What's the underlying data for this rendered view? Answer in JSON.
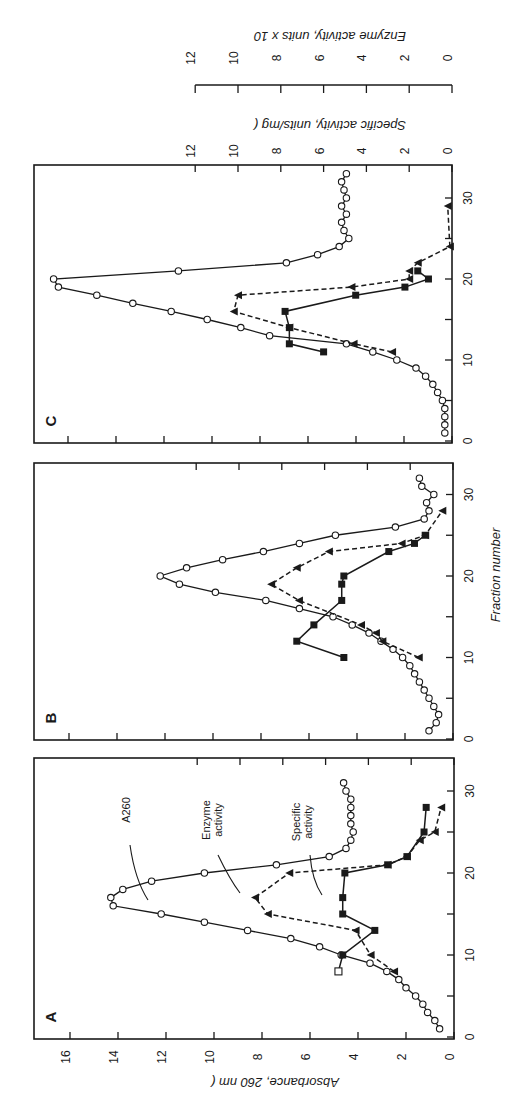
{
  "chart_data": [
    {
      "panel": "A",
      "type": "line",
      "title": "A",
      "xlabel": "Fraction number",
      "ylabel": "Absorbance, 260 nm (o—o)",
      "y2label": "Specific activity, units/mg (■—■)",
      "y3label": "Enzyme activity, units x 10^3 (▲- - -▲)",
      "xlim": [
        0,
        33
      ],
      "ylim": [
        0,
        17
      ],
      "x_ticks": [
        0,
        10,
        20,
        30
      ],
      "y_ticks": [
        0,
        2,
        4,
        6,
        8,
        10,
        12,
        14,
        16
      ],
      "annotations": [
        "A260",
        "Enzyme activity",
        "Specific activity"
      ],
      "series": [
        {
          "name": "A260",
          "marker": "open-circle",
          "line": "solid",
          "x": [
            1,
            2,
            3,
            4,
            5,
            6,
            7,
            8,
            9,
            10,
            11,
            12,
            13,
            14,
            15,
            16,
            17,
            18,
            19,
            20,
            21,
            22,
            23,
            24,
            25,
            26,
            27,
            28,
            29,
            30,
            31
          ],
          "y": [
            0.6,
            0.8,
            1.1,
            1.3,
            1.6,
            2.0,
            2.3,
            2.8,
            3.5,
            4.7,
            5.6,
            6.8,
            8.6,
            10.4,
            12.2,
            14.2,
            14.3,
            13.8,
            12.6,
            10.4,
            7.4,
            5.2,
            4.5,
            4.3,
            4.2,
            4.3,
            4.3,
            4.3,
            4.3,
            4.5,
            4.6
          ]
        },
        {
          "name": "Specific activity",
          "marker": "filled-square",
          "line": "solid",
          "x": [
            8,
            10,
            13,
            15,
            17,
            20,
            21,
            22,
            25,
            28
          ],
          "y": [
            5.4,
            5.2,
            3.7,
            5.2,
            5.2,
            5.1,
            3.1,
            2.2,
            1.4,
            1.3
          ]
        },
        {
          "name": "Enzyme activity",
          "marker": "filled-triangle",
          "line": "dashed",
          "x": [
            8,
            10,
            13,
            15,
            17,
            20,
            21,
            22,
            24,
            25,
            28
          ],
          "y": [
            2.8,
            3.9,
            4.6,
            8.7,
            9.3,
            7.7,
            3.1,
            2.2,
            1.6,
            0.9,
            0.6
          ]
        }
      ]
    },
    {
      "panel": "B",
      "type": "line",
      "title": "B",
      "xlabel": "Fraction number",
      "xlim": [
        0,
        33
      ],
      "x_ticks": [
        0,
        10,
        20,
        30
      ],
      "series": [
        {
          "name": "A260",
          "marker": "open-circle",
          "line": "solid",
          "x": [
            1,
            2,
            3,
            4,
            5,
            6,
            7,
            8,
            9,
            10,
            11,
            12,
            13,
            14,
            15,
            16,
            17,
            18,
            19,
            20,
            21,
            22,
            23,
            24,
            25,
            26,
            27,
            28,
            29,
            30,
            31,
            32
          ],
          "y": [
            1.0,
            0.7,
            0.6,
            0.8,
            1.0,
            1.2,
            1.4,
            1.6,
            1.8,
            2.1,
            2.5,
            3.0,
            3.5,
            4.2,
            5.0,
            6.4,
            7.8,
            9.9,
            11.4,
            12.2,
            11.1,
            9.6,
            7.9,
            6.4,
            4.9,
            2.4,
            1.2,
            1.0,
            1.1,
            0.8,
            1.3,
            1.4
          ]
        },
        {
          "name": "Specific activity",
          "marker": "filled-square",
          "line": "solid",
          "x": [
            10,
            12,
            14,
            17,
            19,
            20,
            23,
            24,
            25
          ],
          "y": [
            5.1,
            7.3,
            6.5,
            5.2,
            5.2,
            5.1,
            3.0,
            1.8,
            1.3
          ]
        },
        {
          "name": "Enzyme activity",
          "marker": "filled-triangle",
          "line": "dashed",
          "x": [
            10,
            12,
            13,
            14,
            17,
            19,
            21,
            23,
            24,
            25,
            28
          ],
          "y": [
            1.6,
            3.3,
            3.6,
            4.3,
            7.2,
            8.5,
            7.3,
            5.8,
            2.4,
            1.3,
            0.5
          ]
        }
      ]
    },
    {
      "panel": "C",
      "type": "line",
      "title": "C",
      "xlabel": "Fraction number",
      "xlim": [
        0,
        33
      ],
      "x_ticks": [
        0,
        10,
        20,
        30
      ],
      "y2_ticks": [
        0,
        2,
        4,
        6,
        8,
        10,
        12
      ],
      "y3_ticks": [
        0,
        2,
        4,
        6,
        8,
        10,
        12
      ],
      "series": [
        {
          "name": "A260",
          "marker": "open-circle",
          "line": "solid",
          "x": [
            1,
            2,
            3,
            4,
            5,
            6,
            7,
            8,
            9,
            10,
            11,
            12,
            13,
            14,
            15,
            16,
            17,
            18,
            19,
            20,
            21,
            22,
            23,
            24,
            25,
            26,
            27,
            28,
            29,
            30,
            31,
            32,
            33
          ],
          "y": [
            0.3,
            0.3,
            0.3,
            0.3,
            0.4,
            0.6,
            0.8,
            1.1,
            1.5,
            2.3,
            3.3,
            4.4,
            7.6,
            8.8,
            10.2,
            11.7,
            13.3,
            14.8,
            16.4,
            16.6,
            11.4,
            6.9,
            5.6,
            4.7,
            4.3,
            4.5,
            4.6,
            4.4,
            4.6,
            4.4,
            4.5,
            4.6,
            4.4
          ]
        },
        {
          "name": "Specific activity",
          "marker": "filled-square",
          "line": "solid",
          "x": [
            11,
            12,
            14,
            16,
            18,
            19,
            20,
            21
          ],
          "y": [
            6.0,
            7.6,
            7.6,
            7.8,
            4.5,
            2.2,
            1.1,
            1.6
          ]
        },
        {
          "name": "Enzyme activity",
          "marker": "filled-triangle",
          "line": "dashed",
          "x": [
            11,
            12,
            14,
            16,
            18,
            19,
            20,
            21,
            22,
            24,
            29
          ],
          "y": [
            2.8,
            4.6,
            7.6,
            10.2,
            10.0,
            4.7,
            2.0,
            2.0,
            1.6,
            0.1,
            0.2
          ]
        }
      ]
    }
  ],
  "labels": {
    "panel_a": "A",
    "panel_b": "B",
    "panel_c": "C",
    "x_axis_title": "Fraction number",
    "y_axis_title": "Absorbance, 260 nm (",
    "y_axis_title_end": ")",
    "y2_axis_title": "Specific activity, units/mg (",
    "y2_axis_title_end": ")",
    "y3_axis_title": "Enzyme activity, units x 10",
    "y3_exp": "3",
    "y3_axis_title_end": "(      )",
    "ann_a260": "A260",
    "ann_enzyme_1": "Enzyme",
    "ann_enzyme_2": "activity",
    "ann_specific_1": "Specific",
    "ann_specific_2": "activity"
  },
  "ticks": {
    "fraction": [
      "0",
      "10",
      "20",
      "30"
    ],
    "absorbance": [
      "0",
      "2",
      "4",
      "6",
      "8",
      "10",
      "12",
      "14",
      "16"
    ],
    "secondary": [
      "0",
      "2",
      "4",
      "6",
      "8",
      "10",
      "12"
    ]
  }
}
